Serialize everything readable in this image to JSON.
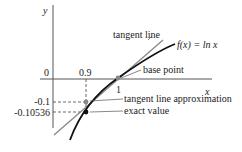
{
  "diagram": {
    "axes": {
      "x_label": "x",
      "y_label": "y",
      "origin_label": "0"
    },
    "ticks": {
      "x_09": "0.9",
      "x_1": "1",
      "y_01": "-0.1",
      "y_010536": "-0.10536"
    },
    "labels": {
      "tangent_line": "tangent line",
      "function": "f(x) = ln x",
      "base_point": "base point",
      "approximation": "tangent line approximation",
      "exact_value": "exact value"
    },
    "colors": {
      "curve": "#111111",
      "tangent": "#888888",
      "axis": "#555555",
      "approx_point": "#888888",
      "exact_point": "#111111"
    }
  }
}
